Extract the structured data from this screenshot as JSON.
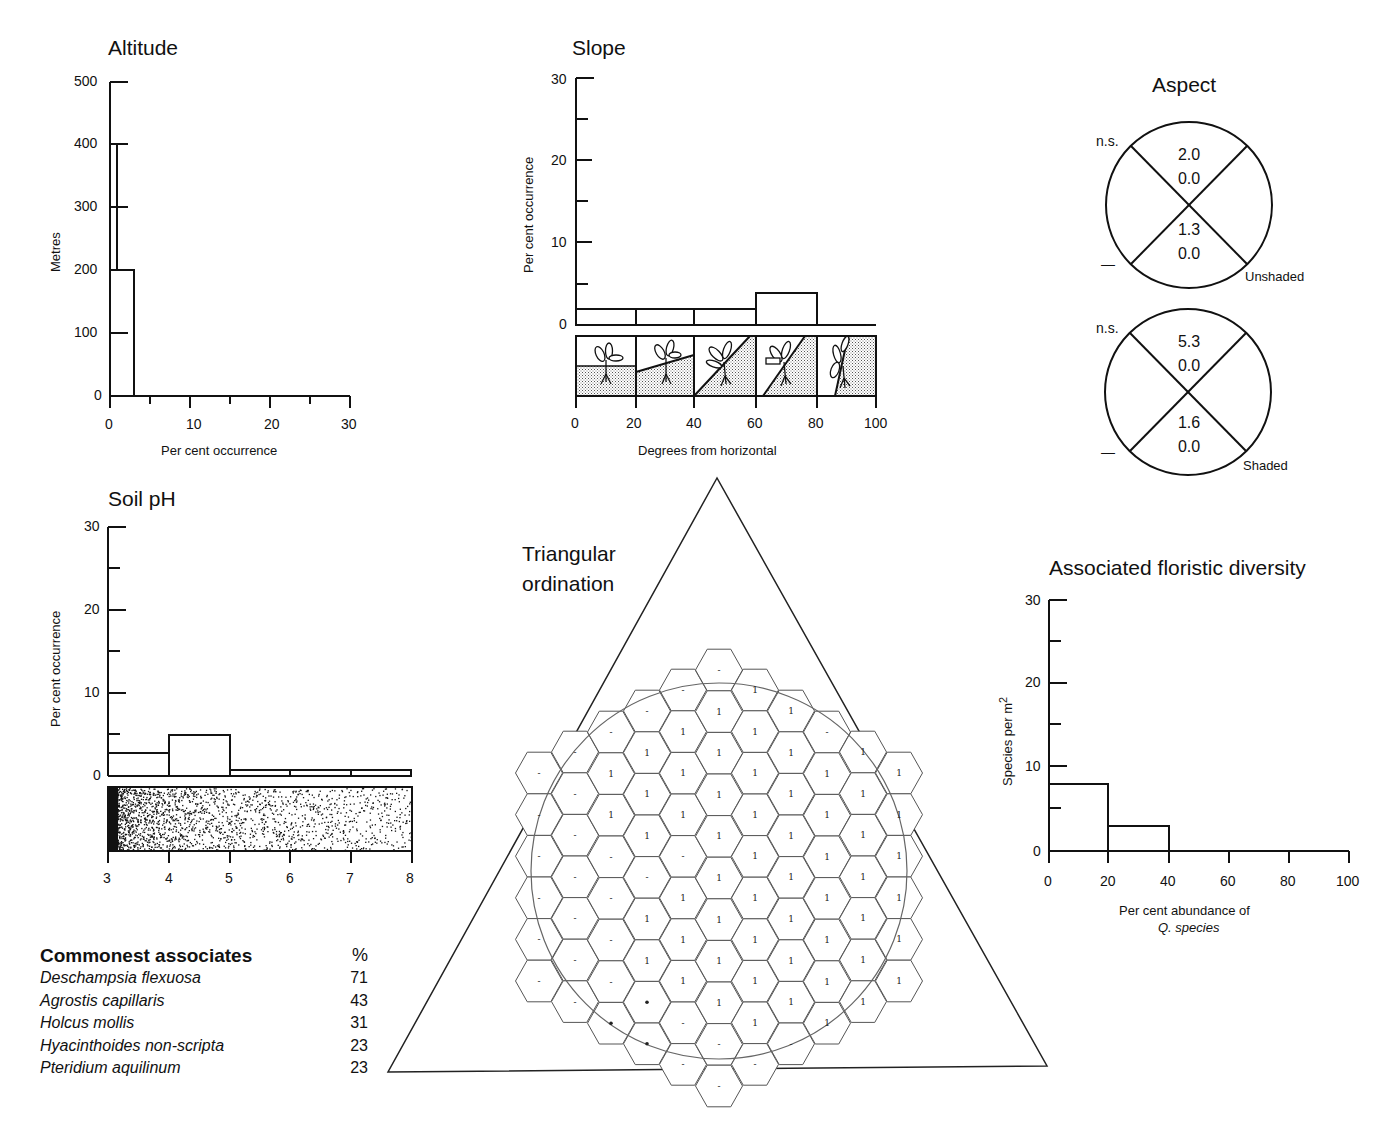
{
  "altitude": {
    "title": "Altitude",
    "ylabel": "Metres",
    "xlabel": "Per cent occurrence",
    "yticks": [
      "500",
      "400",
      "300",
      "200",
      "100",
      "0"
    ],
    "xticks": [
      "0",
      "10",
      "20",
      "30"
    ]
  },
  "slope": {
    "title": "Slope",
    "ylabel": "Per cent occurrence",
    "xlabel": "Degrees from horizontal",
    "yticks": [
      "30",
      "20",
      "10",
      "0"
    ],
    "xticks": [
      "0",
      "20",
      "40",
      "60",
      "80",
      "100"
    ]
  },
  "aspect": {
    "title": "Aspect",
    "unshaded": {
      "label": "Unshaded",
      "ns": "n.s.",
      "dash": "—",
      "top": [
        "2.0",
        "0.0"
      ],
      "bottom": [
        "1.3",
        "0.0"
      ]
    },
    "shaded": {
      "label": "Shaded",
      "ns": "n.s.",
      "dash": "—",
      "top": [
        "5.3",
        "0.0"
      ],
      "bottom": [
        "1.6",
        "0.0"
      ]
    }
  },
  "soil_ph": {
    "title": "Soil pH",
    "ylabel": "Per cent occurrence",
    "yticks": [
      "30",
      "20",
      "10",
      "0"
    ],
    "xticks": [
      "3",
      "4",
      "5",
      "6",
      "7",
      "8"
    ]
  },
  "triangular": {
    "title_line1": "Triangular",
    "title_line2": "ordination"
  },
  "diversity": {
    "title": "Associated floristic diversity",
    "ylabel": "Species  per  m",
    "ylabel_sup": "2",
    "xlabel_line1": "Per cent abundance of",
    "xlabel_line2": "Q. species",
    "yticks": [
      "30",
      "20",
      "10",
      "0"
    ],
    "xticks": [
      "0",
      "20",
      "40",
      "60",
      "80",
      "100"
    ]
  },
  "associates": {
    "title": "Commonest associates",
    "pct_header": "%",
    "rows": [
      {
        "species": "Deschampsia flexuosa",
        "pct": "71"
      },
      {
        "species": "Agrostis capillaris",
        "pct": "43"
      },
      {
        "species": "Holcus mollis",
        "pct": "31"
      },
      {
        "species": "Hyacinthoides non-scripta",
        "pct": "23"
      },
      {
        "species": "Pteridium aquilinum",
        "pct": "23"
      }
    ]
  },
  "chart_data": [
    {
      "type": "bar",
      "title": "Altitude",
      "orientation": "horizontal",
      "xlabel": "Per cent occurrence",
      "ylabel": "Metres",
      "categories": [
        "0-200",
        "200-400",
        "400-500"
      ],
      "values": [
        3,
        1,
        0
      ],
      "xlim": [
        0,
        30
      ],
      "ylim": [
        0,
        500
      ],
      "grid": false
    },
    {
      "type": "bar",
      "title": "Slope",
      "xlabel": "Degrees from horizontal",
      "ylabel": "Per cent occurrence",
      "categories": [
        "0-20",
        "20-40",
        "40-60",
        "60-80",
        "80-100"
      ],
      "values": [
        2,
        2,
        2,
        4,
        0
      ],
      "ylim": [
        0,
        30
      ],
      "grid": false
    },
    {
      "type": "table",
      "title": "Aspect",
      "series": [
        {
          "name": "Unshaded",
          "north": [
            2.0,
            0.0
          ],
          "south": [
            1.3,
            0.0
          ],
          "significance": "n.s."
        },
        {
          "name": "Shaded",
          "north": [
            5.3,
            0.0
          ],
          "south": [
            1.6,
            0.0
          ],
          "significance": "n.s."
        }
      ]
    },
    {
      "type": "bar",
      "title": "Soil pH",
      "xlabel": "pH",
      "ylabel": "Per cent occurrence",
      "categories": [
        "3-4",
        "4-5",
        "5-6",
        "6-7",
        "7-8"
      ],
      "values": [
        2.7,
        5,
        0.7,
        0.7,
        0.7
      ],
      "ylim": [
        0,
        30
      ],
      "grid": false
    },
    {
      "type": "heatmap",
      "title": "Triangular ordination",
      "note": "Hexagonal grid columns left to right; values per cell top to bottom ('-' absent, '1' present, '*' rare)",
      "columns": [
        {
          "x": 539,
          "y0": 773,
          "cells": [
            "-",
            "-",
            "-",
            "-",
            "-",
            "-"
          ]
        },
        {
          "x": 575,
          "y0": 752,
          "cells": [
            "-",
            "-",
            "-",
            "-",
            "-",
            "-",
            "-"
          ]
        },
        {
          "x": 611,
          "y0": 732,
          "cells": [
            "-",
            "1",
            "1",
            "-",
            "-",
            "-",
            "-",
            "*"
          ]
        },
        {
          "x": 647,
          "y0": 711,
          "cells": [
            "-",
            "1",
            "1",
            "1",
            "-",
            "1",
            "1",
            "*",
            "*"
          ]
        },
        {
          "x": 683,
          "y0": 690,
          "cells": [
            "-",
            "1",
            "1",
            "1",
            "-",
            "1",
            "1",
            "1",
            "-",
            "-"
          ]
        },
        {
          "x": 719,
          "y0": 670,
          "cells": [
            "-",
            "1",
            "1",
            "1",
            "1",
            "1",
            "1",
            "1",
            "1",
            "-",
            "-"
          ]
        },
        {
          "x": 755,
          "y0": 690,
          "cells": [
            "1",
            "1",
            "1",
            "1",
            "1",
            "1",
            "1",
            "1",
            "1",
            "-"
          ]
        },
        {
          "x": 791,
          "y0": 711,
          "cells": [
            "1",
            "1",
            "1",
            "1",
            "1",
            "1",
            "1",
            "1",
            "-"
          ]
        },
        {
          "x": 827,
          "y0": 732,
          "cells": [
            "-",
            "1",
            "1",
            "1",
            "1",
            "1",
            "1",
            "1"
          ]
        },
        {
          "x": 863,
          "y0": 752,
          "cells": [
            "1",
            "1",
            "1",
            "1",
            "1",
            "1",
            "1"
          ]
        },
        {
          "x": 899,
          "y0": 773,
          "cells": [
            "1",
            "1",
            "1",
            "1",
            "1",
            "1"
          ]
        }
      ]
    },
    {
      "type": "bar",
      "title": "Associated floristic diversity",
      "xlabel": "Per cent abundance of Q. species",
      "ylabel": "Species per m2",
      "categories": [
        "0-20",
        "20-40",
        "40-60",
        "60-80",
        "80-100"
      ],
      "values": [
        8,
        3,
        0,
        0,
        0
      ],
      "ylim": [
        0,
        30
      ],
      "grid": false
    },
    {
      "type": "table",
      "title": "Commonest associates",
      "columns": [
        "Species",
        "%"
      ],
      "rows": [
        [
          "Deschampsia flexuosa",
          71
        ],
        [
          "Agrostis capillaris",
          43
        ],
        [
          "Holcus mollis",
          31
        ],
        [
          "Hyacinthoides non-scripta",
          23
        ],
        [
          "Pteridium aquilinum",
          23
        ]
      ]
    }
  ]
}
